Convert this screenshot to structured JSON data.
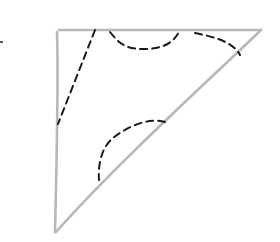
{
  "diagram": {
    "type": "hand-drawn right triangle with dashed cut curves",
    "colors": {
      "outline": "#b8b8b8",
      "dashed": "#1a1a1a",
      "background": "#ffffff"
    },
    "triangle": {
      "vertices": [
        [
          58,
          30
        ],
        [
          262,
          30
        ],
        [
          55,
          232
        ]
      ]
    },
    "dashed_curves": [
      {
        "id": "left-cut",
        "path": "M95,30 L58,124"
      },
      {
        "id": "top-middle-arc",
        "path": "M110,32 C118,42 124,49 143,49 C165,49 174,42 180,30"
      },
      {
        "id": "top-right-arc",
        "path": "M195,33 C215,37 233,42 240,55"
      },
      {
        "id": "lower-arc",
        "path": "M165,122 C150,117 128,126 113,138 C101,148 98,165 99,180"
      }
    ],
    "edge_mark": {
      "x": 1,
      "y": 42
    }
  }
}
